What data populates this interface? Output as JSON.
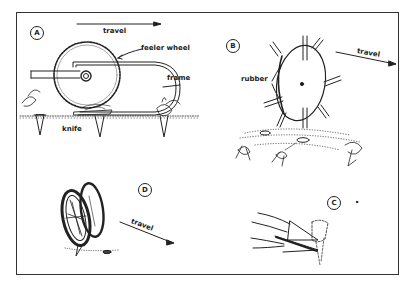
{
  "figure": {
    "panels": [
      {
        "id": "A",
        "marker": "A",
        "labels": {
          "travel": "travel",
          "feeler_wheel": "feeler wheel",
          "frame": "frame",
          "knife": "knife"
        }
      },
      {
        "id": "B",
        "marker": "B",
        "labels": {
          "rubber": "rubber",
          "travel": "travel"
        }
      },
      {
        "id": "C",
        "marker": "C",
        "labels": {}
      },
      {
        "id": "D",
        "marker": "D",
        "labels": {
          "travel": "travel"
        }
      }
    ]
  },
  "colors": {
    "ink": "#222222",
    "background": "#ffffff",
    "border": "#333333"
  }
}
